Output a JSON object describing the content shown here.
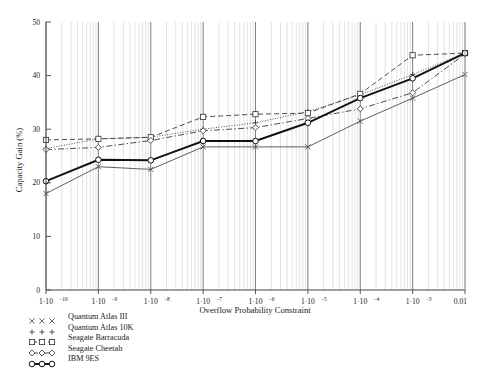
{
  "chart_data": {
    "type": "line",
    "title": "",
    "xlabel": "Overflow Probability Constraint",
    "ylabel": "Capacity Gain (%)",
    "xscale": "log",
    "xlim": [
      1e-10,
      0.01
    ],
    "ylim": [
      0,
      50
    ],
    "yticks": [
      0,
      10,
      20,
      30,
      40,
      50
    ],
    "ytick_labels": [
      "0",
      "10",
      "20",
      "30",
      "40",
      "50"
    ],
    "xticks": [
      1e-10,
      1e-09,
      1e-08,
      1e-07,
      1e-06,
      1e-05,
      0.0001,
      0.001,
      0.01
    ],
    "xtick_labels": [
      {
        "mantissa": "1·10",
        "exp": "−10"
      },
      {
        "mantissa": "1·10",
        "exp": "−9"
      },
      {
        "mantissa": "1·10",
        "exp": "−8"
      },
      {
        "mantissa": "1·10",
        "exp": "−7"
      },
      {
        "mantissa": "1·10",
        "exp": "−6"
      },
      {
        "mantissa": "1·10",
        "exp": "−5"
      },
      {
        "mantissa": "1·10",
        "exp": "−4"
      },
      {
        "mantissa": "1·10",
        "exp": "−3"
      },
      {
        "mantissa": "0.01",
        "exp": ""
      }
    ],
    "grid": "minor-vertical-log",
    "legend_position": "below-axes",
    "x": [
      1e-10,
      1e-09,
      1e-08,
      1e-07,
      1e-06,
      1e-05,
      0.0001,
      0.001,
      0.01
    ],
    "series": [
      {
        "name": "Quantum Atlas III",
        "marker": "x",
        "linestyle": "solid",
        "color": "#4d4d4d",
        "values": [
          18.0,
          23.0,
          22.5,
          26.7,
          26.7,
          26.7,
          31.5,
          35.8,
          40.2
        ]
      },
      {
        "name": "Quantum Atlas 10K",
        "marker": "+",
        "linestyle": "dotted",
        "color": "#3a3a3a",
        "values": [
          26.4,
          28.2,
          28.5,
          30.0,
          31.2,
          33.3,
          36.4,
          40.2,
          44.2
        ]
      },
      {
        "name": "Seagate Barracuda",
        "marker": "square",
        "linestyle": "dashed",
        "color": "#3a3a3a",
        "values": [
          28.0,
          28.2,
          28.5,
          32.3,
          32.8,
          33.0,
          36.6,
          43.8,
          44.2
        ]
      },
      {
        "name": "Seagate Cheetah",
        "marker": "diamond",
        "linestyle": "dashdot",
        "color": "#3a3a3a",
        "values": [
          26.2,
          26.6,
          27.9,
          29.7,
          30.3,
          32.0,
          33.8,
          36.8,
          44.0
        ]
      },
      {
        "name": "IBM 9ES",
        "marker": "circle",
        "linestyle": "solid-thick",
        "color": "#111111",
        "values": [
          20.3,
          24.3,
          24.2,
          27.8,
          27.8,
          31.2,
          35.8,
          39.5,
          44.2
        ]
      }
    ]
  },
  "legend": {
    "items": [
      {
        "label": "Quantum Atlas III",
        "key": "x"
      },
      {
        "label": "Quantum Atlas 10K",
        "key": "+"
      },
      {
        "label": "Seagate Barracuda",
        "key": "square"
      },
      {
        "label": "Seagate Cheetah",
        "key": "diamond"
      },
      {
        "label": "IBM 9ES",
        "key": "circle"
      }
    ]
  }
}
